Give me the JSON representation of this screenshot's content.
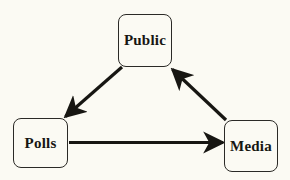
{
  "diagram": {
    "background_color": "#fbfaf3",
    "line_color": "#171612",
    "box_border_color": "#2b2a26",
    "text_color": "#171612",
    "nodes": [
      {
        "id": "public",
        "label": "Public",
        "x": 118,
        "y": 14,
        "width": 54,
        "height": 53
      },
      {
        "id": "polls",
        "label": "Polls",
        "x": 13,
        "y": 118,
        "width": 55,
        "height": 50
      },
      {
        "id": "media",
        "label": "Media",
        "x": 224,
        "y": 120,
        "width": 54,
        "height": 52
      }
    ],
    "edges": [
      {
        "id": "public-to-polls",
        "from": "public",
        "to": "polls",
        "label": "",
        "direction": "down-left",
        "arrowhead": "filled"
      },
      {
        "id": "polls-to-media",
        "from": "polls",
        "to": "media",
        "label": "",
        "direction": "right",
        "arrowhead": "filled"
      },
      {
        "id": "media-to-public",
        "from": "media",
        "to": "public",
        "label": "",
        "direction": "up-left",
        "arrowhead": "filled"
      }
    ]
  }
}
